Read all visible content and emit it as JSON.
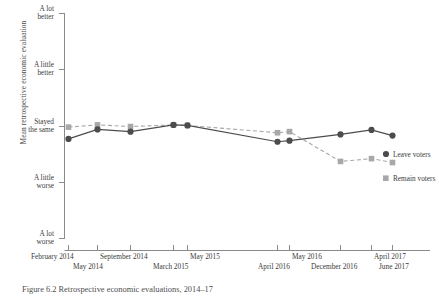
{
  "figure": {
    "caption": "Figure 6.2  Retrospective economic evaluations, 2014–17"
  },
  "chart_data": {
    "type": "line",
    "title": "",
    "xlabel": "",
    "ylabel": "Mean retrospective economic evaluation",
    "grid": false,
    "legend_position": "right-inline",
    "categories": [
      "February 2014",
      "May 2014",
      "September 2014",
      "March 2015",
      "May 2015",
      "April 2016",
      "May 2016",
      "December 2016",
      "April 2017",
      "June 2017"
    ],
    "x_tick_rows": [
      {
        "label": "February 2014",
        "row": 0
      },
      {
        "label": "May 2014",
        "row": 1
      },
      {
        "label": "September 2014",
        "row": 0
      },
      {
        "label": "March 2015",
        "row": 1
      },
      {
        "label": "May 2015",
        "row": 0
      },
      {
        "label": "April 2016",
        "row": 1
      },
      {
        "label": "May 2016",
        "row": 0
      },
      {
        "label": "December 2016",
        "row": 1
      },
      {
        "label": "April 2017",
        "row": 0
      },
      {
        "label": "June 2017",
        "row": 1
      }
    ],
    "y_tick_labels": [
      "A lot\nbetter",
      "A little\nbetter",
      "Stayed\nthe same",
      "A little\nworse",
      "A lot\nworse"
    ],
    "y_tick_values": [
      5,
      4,
      3,
      2,
      1
    ],
    "ylim": [
      1,
      5
    ],
    "series": [
      {
        "name": "Leave voters",
        "color": "#4c4c4c",
        "marker": "circle",
        "line_style": "solid",
        "values": [
          2.77,
          2.94,
          2.9,
          3.02,
          3.01,
          2.72,
          2.74,
          2.85,
          2.93,
          2.83
        ]
      },
      {
        "name": "Remain voters",
        "color": "#a8a8a8",
        "marker": "square",
        "line_style": "dashed",
        "values": [
          2.98,
          3.02,
          2.99,
          3.02,
          3.01,
          2.88,
          2.9,
          2.37,
          2.42,
          2.35
        ]
      }
    ]
  },
  "legend": {
    "leave_label": "Leave voters",
    "remain_label": "Remain voters"
  }
}
